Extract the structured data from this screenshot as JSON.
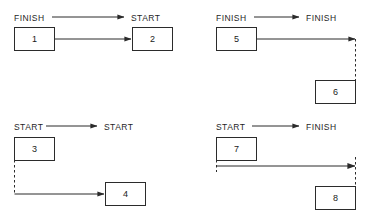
{
  "diagram": {
    "panels": [
      {
        "id": "finish-to-start",
        "header": {
          "from_label": "FINISH",
          "to_label": "START",
          "arrow": "arrow-right-icon"
        },
        "boxes": [
          {
            "label": "1",
            "role": "predecessor"
          },
          {
            "label": "2",
            "role": "successor"
          }
        ],
        "link": {
          "from_point": "finish-of-1",
          "to_point": "start-of-2",
          "style": "solid-horizontal-arrow"
        }
      },
      {
        "id": "finish-to-finish",
        "header": {
          "from_label": "FINISH",
          "to_label": "FINISH",
          "arrow": "arrow-right-icon"
        },
        "boxes": [
          {
            "label": "5",
            "role": "predecessor"
          },
          {
            "label": "6",
            "role": "successor"
          }
        ],
        "link": {
          "from_point": "finish-of-5",
          "to_point": "finish-of-6",
          "style": "solid-horizontal-arrow-with-dashed-drop"
        }
      },
      {
        "id": "start-to-start",
        "header": {
          "from_label": "START",
          "to_label": "START",
          "arrow": "arrow-right-icon"
        },
        "boxes": [
          {
            "label": "3",
            "role": "predecessor"
          },
          {
            "label": "4",
            "role": "successor"
          }
        ],
        "link": {
          "from_point": "start-of-3",
          "to_point": "start-of-4",
          "style": "dashed-drop-then-solid-horizontal-arrow"
        }
      },
      {
        "id": "start-to-finish",
        "header": {
          "from_label": "START",
          "to_label": "FINISH",
          "arrow": "arrow-right-icon"
        },
        "boxes": [
          {
            "label": "7",
            "role": "predecessor"
          },
          {
            "label": "8",
            "role": "successor"
          }
        ],
        "link": {
          "from_point": "start-of-7",
          "to_point": "finish-of-8",
          "style": "dashed-drop-solid-horizontal-arrow-dashed-drop"
        }
      }
    ],
    "colors": {
      "line": "#2b2b2b",
      "box_border": "#2b2b2b",
      "background": "#ffffff",
      "text": "#1f1f1f"
    }
  }
}
